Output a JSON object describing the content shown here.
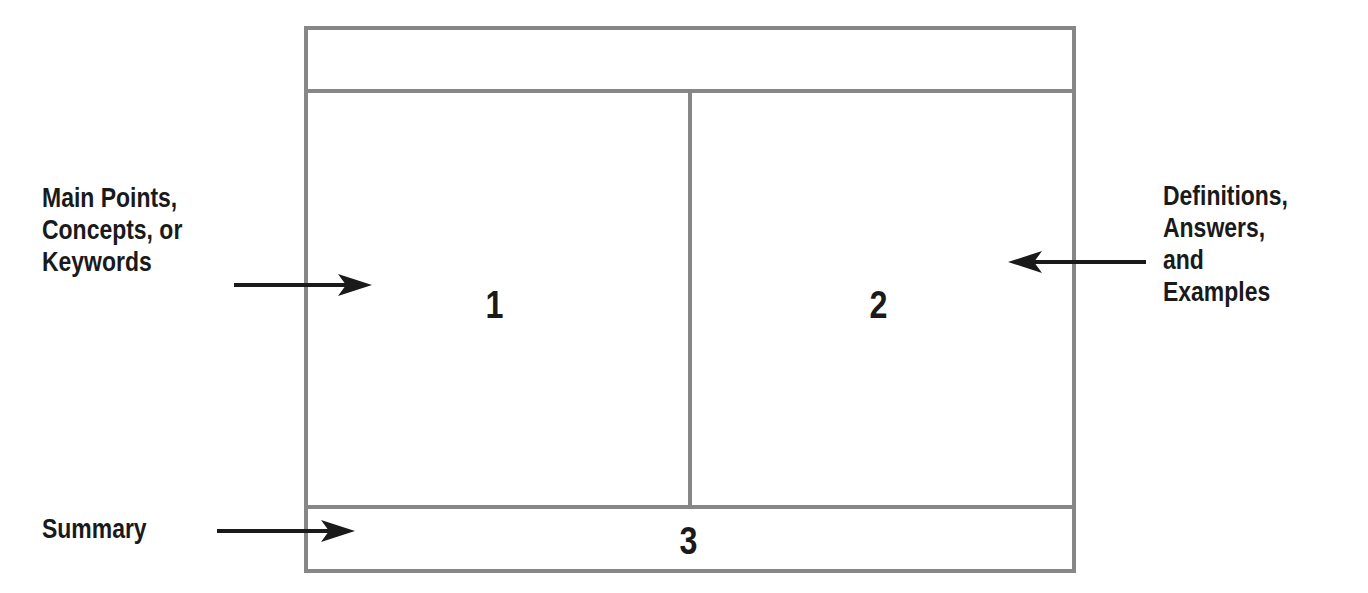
{
  "diagram": {
    "sections": [
      {
        "id": "header",
        "label": ""
      },
      {
        "id": "cue-column",
        "number": "1"
      },
      {
        "id": "notes-column",
        "number": "2"
      },
      {
        "id": "summary",
        "number": "3"
      }
    ],
    "annotations": {
      "left_main": [
        "Main Points,",
        "Concepts, or",
        "Keywords"
      ],
      "right_main": [
        "Definitions,",
        "Answers,",
        "and",
        "Examples"
      ],
      "summary": "Summary"
    },
    "colors": {
      "border": "#878787",
      "text": "#1a1a1a",
      "arrow": "#1a1a1a"
    }
  }
}
